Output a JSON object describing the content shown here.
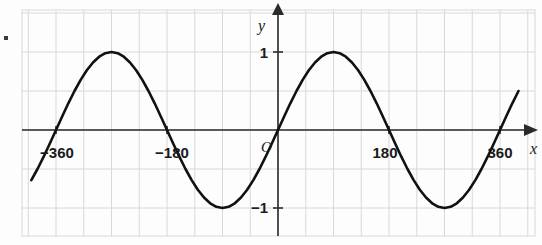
{
  "figure": {
    "colors": {
      "background": "#fdfdfd",
      "grid": "#d8d8d8",
      "axis": "#2a2a2a",
      "curve": "#111111"
    },
    "axis_labels": {
      "x": "x",
      "y": "y",
      "origin": "O"
    },
    "x_tick_labels": [
      {
        "text": "−360",
        "value": -360
      },
      {
        "text": "−180",
        "value": -180
      },
      {
        "text": "180",
        "value": 180
      },
      {
        "text": "360",
        "value": 360
      }
    ],
    "y_tick_labels": [
      {
        "text": "1",
        "value": 1
      },
      {
        "text": "−1",
        "value": -1
      }
    ],
    "corner_mark": "•"
  },
  "chart_data": {
    "type": "line",
    "title": "",
    "xlabel": "x",
    "ylabel": "y",
    "function": "y = sin(x)",
    "angle_unit": "degrees",
    "xlim": [
      -400,
      392
    ],
    "ylim": [
      -1.6,
      1.6
    ],
    "grid": true,
    "grid_x_step": 45,
    "grid_y_step": 0.5,
    "legend": "none",
    "x_ticks": [
      -360,
      -180,
      180,
      360
    ],
    "y_ticks": [
      1,
      -1
    ],
    "annotations": [
      {
        "text": "O",
        "x": 0,
        "y": 0,
        "role": "origin"
      }
    ],
    "series": [
      {
        "name": "y = sin(x)",
        "x": [
          -400,
          -390,
          -380,
          -370,
          -360,
          -350,
          -340,
          -330,
          -320,
          -310,
          -300,
          -290,
          -280,
          -270,
          -260,
          -250,
          -240,
          -230,
          -220,
          -210,
          -200,
          -190,
          -180,
          -170,
          -160,
          -150,
          -140,
          -130,
          -120,
          -110,
          -100,
          -90,
          -80,
          -70,
          -60,
          -50,
          -40,
          -30,
          -20,
          -10,
          0,
          10,
          20,
          30,
          40,
          50,
          60,
          70,
          80,
          90,
          100,
          110,
          120,
          130,
          140,
          150,
          160,
          170,
          180,
          190,
          200,
          210,
          220,
          230,
          240,
          250,
          260,
          270,
          280,
          290,
          300,
          310,
          320,
          330,
          340,
          350,
          360,
          370,
          380,
          390
        ],
        "y": [
          -0.643,
          -0.5,
          -0.342,
          -0.174,
          0.0,
          0.174,
          0.342,
          0.5,
          0.643,
          0.766,
          0.866,
          0.94,
          0.985,
          1.0,
          0.985,
          0.94,
          0.866,
          0.766,
          0.643,
          0.5,
          0.342,
          0.174,
          0.0,
          -0.174,
          -0.342,
          -0.5,
          -0.643,
          -0.766,
          -0.866,
          -0.94,
          -0.985,
          -1.0,
          -0.985,
          -0.94,
          -0.866,
          -0.766,
          -0.643,
          -0.5,
          -0.342,
          -0.174,
          0.0,
          0.174,
          0.342,
          0.5,
          0.643,
          0.766,
          0.866,
          0.94,
          0.985,
          1.0,
          0.985,
          0.94,
          0.866,
          0.766,
          0.643,
          0.5,
          0.342,
          0.174,
          0.0,
          -0.174,
          -0.342,
          -0.5,
          -0.643,
          -0.766,
          -0.866,
          -0.94,
          -0.985,
          -1.0,
          -0.985,
          -0.94,
          -0.866,
          -0.766,
          -0.643,
          -0.5,
          -0.342,
          -0.174,
          0.0,
          0.174,
          0.342,
          0.5
        ]
      }
    ]
  }
}
